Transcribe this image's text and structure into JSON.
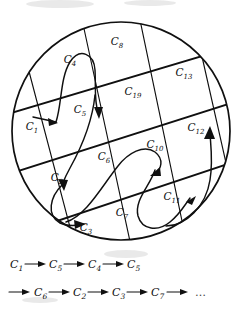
{
  "figure": {
    "kind": "hand-drawn-diagram",
    "ink_color": "#101010",
    "background_color": "#ffffff"
  },
  "circle": {
    "center_x": 121,
    "center_y": 131,
    "radius": 109
  },
  "cells": [
    {
      "id": "C1",
      "base": "C",
      "sub": "1",
      "x": 32,
      "y": 130,
      "note": "entry cell, outside-left arrow points in"
    },
    {
      "id": "C4",
      "base": "C",
      "sub": "4",
      "x": 70,
      "y": 63
    },
    {
      "id": "C8",
      "base": "C",
      "sub": "8",
      "x": 117,
      "y": 45
    },
    {
      "id": "C13",
      "base": "C",
      "sub": "13",
      "x": 184,
      "y": 76
    },
    {
      "id": "C19",
      "base": "C",
      "sub": "19",
      "x": 133,
      "y": 95
    },
    {
      "id": "C5",
      "base": "C",
      "sub": "5",
      "x": 80,
      "y": 113
    },
    {
      "id": "C12",
      "base": "C",
      "sub": "12",
      "x": 196,
      "y": 131
    },
    {
      "id": "C10",
      "base": "C",
      "sub": "10",
      "x": 155,
      "y": 148
    },
    {
      "id": "C6",
      "base": "C",
      "sub": "6",
      "x": 104,
      "y": 160
    },
    {
      "id": "C2",
      "base": "C",
      "sub": "2",
      "x": 57,
      "y": 181
    },
    {
      "id": "C11",
      "base": "C",
      "sub": "11",
      "x": 172,
      "y": 200
    },
    {
      "id": "C7",
      "base": "C",
      "sub": "7",
      "x": 122,
      "y": 216
    },
    {
      "id": "C3",
      "base": "C",
      "sub": "3",
      "x": 86,
      "y": 231
    }
  ],
  "sequence": {
    "line1": [
      {
        "base": "C",
        "sub": "1"
      },
      {
        "base": "C",
        "sub": "5"
      },
      {
        "base": "C",
        "sub": "4"
      },
      {
        "base": "C",
        "sub": "5"
      }
    ],
    "line2": [
      {
        "base": "C",
        "sub": "6"
      },
      {
        "base": "C",
        "sub": "2"
      },
      {
        "base": "C",
        "sub": "3"
      },
      {
        "base": "C",
        "sub": "7"
      }
    ],
    "arrow_glyph": "→",
    "ellipsis": "…",
    "line1_text": "C1 → C5 → C4 → C5",
    "line2_text": "→ C6 → C2 → C3 → C7 → …"
  }
}
